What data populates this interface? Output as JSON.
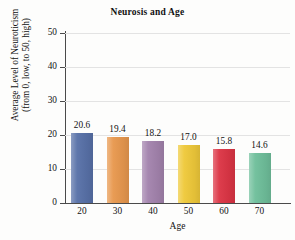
{
  "chart_data": {
    "type": "bar",
    "title": "Neurosis and Age",
    "xlabel": "Age",
    "ylabel_lines": [
      "Average Level of Neuroticism",
      "(from 0, low, to 50, high)"
    ],
    "categories": [
      "20",
      "30",
      "40",
      "50",
      "60",
      "70"
    ],
    "values": [
      20.6,
      19.4,
      18.2,
      17.0,
      15.8,
      14.6
    ],
    "value_labels": [
      "20.6",
      "19.4",
      "18.2",
      "17.0",
      "15.8",
      "14.6"
    ],
    "bar_colors": [
      "#5871a8",
      "#e8984e",
      "#a383ad",
      "#efc93a",
      "#dc3545",
      "#6fbf9b"
    ],
    "ylim": [
      0,
      50
    ],
    "yticks": [
      0,
      10,
      20,
      30,
      40,
      50
    ],
    "ytick_labels": [
      "0",
      "10",
      "20",
      "30",
      "40",
      "50"
    ],
    "grid": true,
    "legend": "none",
    "background_color": "#fdfdfc",
    "axis_color": "#4a4a4a",
    "gridline_color": "#e3e3e3"
  }
}
